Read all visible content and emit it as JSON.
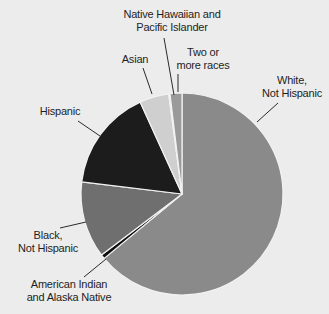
{
  "chart_data": {
    "type": "pie",
    "title": "",
    "note": "No numeric labels are shown in the chart; values are approximate slice shares (%) estimated from slice angles.",
    "start_angle_deg": 0,
    "direction": "clockwise",
    "categories": [
      "White, Not Hispanic",
      "American Indian and Alaska Native",
      "Black, Not Hispanic",
      "Hispanic",
      "Asian",
      "Native Hawaiian and Pacific Islander",
      "Two or more races"
    ],
    "values": [
      64,
      0.7,
      12.2,
      16.3,
      4.7,
      0.2,
      1.9
    ],
    "colors": [
      "#8a8a8a",
      "#0e0e0e",
      "#6f6f6f",
      "#1c1c1c",
      "#cfcfcf",
      "#f4f4f4",
      "#9a9a9a"
    ],
    "legend_position": "none (direct labels with leader lines)"
  },
  "labels": {
    "white": [
      "White,",
      "Not Hispanic"
    ],
    "aian": [
      "American Indian",
      "and Alaska Native"
    ],
    "black": [
      "Black,",
      "Not Hispanic"
    ],
    "hispanic": [
      "Hispanic"
    ],
    "asian": [
      "Asian"
    ],
    "nhpi": [
      "Native Hawaiian and",
      "Pacific Islander"
    ],
    "two": [
      "Two or",
      "more races"
    ]
  }
}
